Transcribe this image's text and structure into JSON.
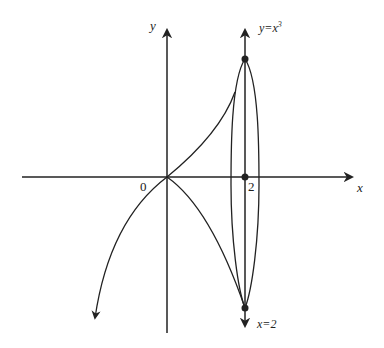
{
  "diagram": {
    "axes": {
      "x_label": "x",
      "y_label": "y",
      "origin_label": "0",
      "tick_label": "2"
    },
    "curves": {
      "cubic_label_y": "y=x",
      "cubic_label_exp": "3",
      "line_label": "x=2"
    },
    "colors": {
      "stroke": "#222222",
      "background": "#ffffff"
    }
  }
}
